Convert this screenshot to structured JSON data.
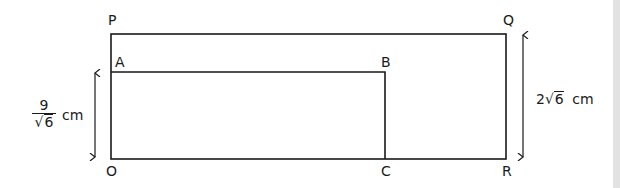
{
  "diagram": {
    "points": {
      "P": "P",
      "Q": "Q",
      "A": "A",
      "B": "B",
      "O": "O",
      "C": "C",
      "R": "R"
    },
    "left_dimension": {
      "numerator": "9",
      "root_symbol": "√",
      "radicand": "6",
      "unit": "cm"
    },
    "right_dimension": {
      "coefficient": "2",
      "root_symbol": "√",
      "radicand": "6",
      "unit": "cm"
    },
    "colors": {
      "line": "#1a1a1a",
      "background": "#ffffff",
      "edge_strip": "#e2e2e2"
    }
  }
}
